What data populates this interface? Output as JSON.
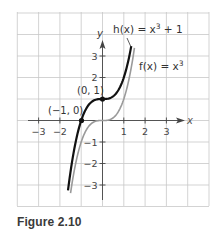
{
  "caption": "Figure 2.10",
  "chart_data": {
    "type": "line",
    "title": "",
    "xlabel": "x",
    "ylabel": "y",
    "xlim": [
      -3.95,
      5.05
    ],
    "ylim": [
      -3.95,
      5.05
    ],
    "grid": true,
    "x_ticks": [
      -3,
      -2,
      1,
      2,
      3
    ],
    "x_tick_labels": [
      "−3",
      "−2",
      "1",
      "2",
      "3"
    ],
    "y_ticks": [
      3,
      2,
      -1,
      -2,
      -3
    ],
    "y_tick_labels": [
      "3",
      "2",
      "−1",
      "−2",
      "−3"
    ],
    "series": [
      {
        "name": "h(x) = x³ + 1",
        "label": "h(x) = x",
        "label_sup": "3",
        "label_tail": " + 1",
        "color": "#111111",
        "expression": "x^3 + 1",
        "domain": [
          -1.62,
          1.35
        ],
        "points": [
          [
            -1.6,
            -3.1
          ],
          [
            -1.5,
            -2.375
          ],
          [
            -1,
            0
          ],
          [
            -0.5,
            0.875
          ],
          [
            0,
            1
          ],
          [
            0.5,
            1.125
          ],
          [
            1,
            2
          ],
          [
            1.3,
            3.2
          ]
        ]
      },
      {
        "name": "f(x) = x³",
        "label": "f(x) = x",
        "label_sup": "3",
        "color": "#9a9a9a",
        "expression": "x^3",
        "domain": [
          -1.5,
          1.5
        ],
        "points": [
          [
            -1.5,
            -3.375
          ],
          [
            -1,
            -1
          ],
          [
            -0.5,
            -0.125
          ],
          [
            0,
            0
          ],
          [
            0.5,
            0.125
          ],
          [
            1,
            1
          ],
          [
            1.5,
            3.375
          ]
        ]
      }
    ],
    "annotations": [
      {
        "text": "(0, 1)",
        "x": 0,
        "y": 1
      },
      {
        "text": "(−1, 0)",
        "x": -1,
        "y": 0
      }
    ]
  }
}
